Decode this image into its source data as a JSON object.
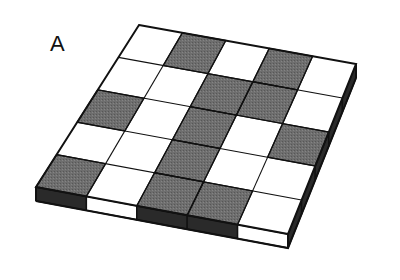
{
  "figure": {
    "panel_label": "A",
    "label_position": {
      "x": 50,
      "y": 33
    },
    "caption_text": "",
    "background_color": "#ffffff"
  },
  "colors": {
    "light_square": "#ffffff",
    "dark_square": "#6e6e6e",
    "outline": "#111111",
    "side_face_dark": "#2a2a2a",
    "side_face_light": "#ffffff",
    "label_color": "#111111"
  },
  "geometry": {
    "rows": 5,
    "cols": 5,
    "top_face_corners": {
      "far": {
        "x": 139,
        "y": 25
      },
      "right": {
        "x": 356,
        "y": 64
      },
      "near": {
        "x": 288,
        "y": 234
      },
      "left": {
        "x": 36,
        "y": 187
      }
    },
    "slab_thickness_px": 14,
    "outline_width_px": 2,
    "grid_line_width_px": 1.1
  },
  "chart_data": {
    "type": "heatmap",
    "title": "A",
    "xlabel": "",
    "ylabel": "",
    "rows": 5,
    "cols": 5,
    "row_labels": [
      "row-1-far",
      "row-2",
      "row-3",
      "row-4",
      "row-5-near"
    ],
    "col_labels": [
      "col-1-left",
      "col-2",
      "col-3",
      "col-4",
      "col-5-right"
    ],
    "value_legend": {
      "0": "light",
      "1": "dark"
    },
    "grid": [
      [
        0,
        1,
        0,
        1,
        0
      ],
      [
        0,
        0,
        1,
        1,
        0
      ],
      [
        1,
        0,
        1,
        0,
        1
      ],
      [
        0,
        0,
        1,
        0,
        0
      ],
      [
        1,
        0,
        1,
        1,
        0
      ]
    ]
  },
  "edges": {
    "near_left_face_segments": [
      1,
      0,
      1,
      1,
      0
    ],
    "near_right_face_segments": [
      1,
      1,
      1,
      1,
      1
    ]
  }
}
